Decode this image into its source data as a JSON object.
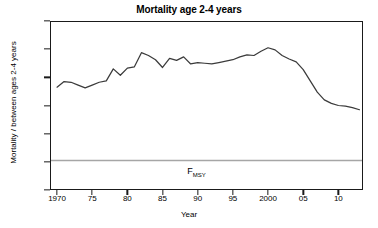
{
  "chart_data": {
    "type": "line",
    "title": "Mortality age 2-4 years",
    "xlabel": "Year",
    "ylabel": "Mortality / between ages 2-4 years",
    "xlim": [
      1969,
      1913.5
    ],
    "x_range": [
      1969.0,
      2013.5
    ],
    "ylim": [
      0.0,
      1.2
    ],
    "grid": false,
    "legend": "none",
    "y_ticks": [
      "1.2",
      "1.0",
      "0.8",
      "0.6",
      "0.4",
      "0.2",
      "0.0"
    ],
    "y_tick_values": [
      1.2,
      1.0,
      0.8,
      0.6,
      0.4,
      0.2,
      0.0
    ],
    "x_ticks": [
      "1970",
      "75",
      "80",
      "85",
      "90",
      "95",
      "2000",
      "05",
      "10"
    ],
    "x_tick_values": [
      1970,
      1975,
      1980,
      1985,
      1990,
      1995,
      2000,
      2005,
      2010
    ],
    "line_color": "#3b3b3b",
    "reference_line": {
      "label": "F",
      "label_sub": "MSY",
      "value": 0.21,
      "color": "#a6a6a6",
      "text_x": 1988.5,
      "text_y": 0.115
    },
    "x": [
      1970,
      1971,
      1972,
      1973,
      1974,
      1975,
      1976,
      1977,
      1978,
      1979,
      1980,
      1981,
      1982,
      1983,
      1984,
      1985,
      1986,
      1987,
      1988,
      1989,
      1990,
      1991,
      1992,
      1993,
      1994,
      1995,
      1996,
      1997,
      1998,
      1999,
      2000,
      2001,
      2002,
      2003,
      2004,
      2005,
      2006,
      2007,
      2008,
      2009,
      2010,
      2011,
      2012,
      2013
    ],
    "values": [
      0.73,
      0.77,
      0.765,
      0.745,
      0.725,
      0.745,
      0.765,
      0.775,
      0.86,
      0.815,
      0.865,
      0.875,
      0.975,
      0.955,
      0.925,
      0.87,
      0.935,
      0.92,
      0.945,
      0.895,
      0.905,
      0.9,
      0.895,
      0.905,
      0.915,
      0.925,
      0.945,
      0.96,
      0.955,
      0.985,
      1.01,
      0.995,
      0.955,
      0.93,
      0.91,
      0.855,
      0.775,
      0.695,
      0.64,
      0.615,
      0.6,
      0.595,
      0.585,
      0.57
    ],
    "series": [
      {
        "name": "Mortality age 2-4 years",
        "values": [
          0.73,
          0.77,
          0.765,
          0.745,
          0.725,
          0.745,
          0.765,
          0.775,
          0.86,
          0.815,
          0.865,
          0.875,
          0.975,
          0.955,
          0.925,
          0.87,
          0.935,
          0.92,
          0.945,
          0.895,
          0.905,
          0.9,
          0.895,
          0.905,
          0.915,
          0.925,
          0.945,
          0.96,
          0.955,
          0.985,
          1.01,
          0.995,
          0.955,
          0.93,
          0.91,
          0.855,
          0.775,
          0.695,
          0.64,
          0.615,
          0.6,
          0.595,
          0.585,
          0.57
        ]
      }
    ]
  }
}
